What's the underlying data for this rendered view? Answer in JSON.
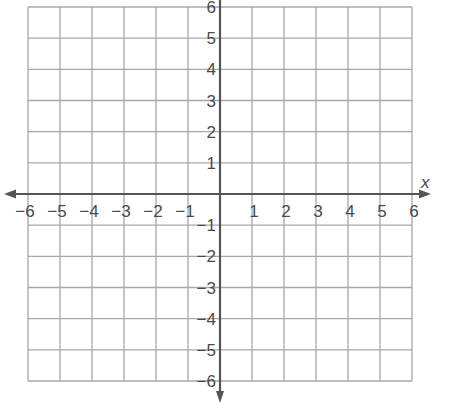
{
  "chart_data": {
    "type": "scatter",
    "title": "",
    "xlabel": "x",
    "ylabel": "",
    "xlim": [
      -6,
      6
    ],
    "ylim": [
      -6,
      6
    ],
    "grid": true,
    "grid_step": 1,
    "x_ticks": [
      -6,
      -5,
      -4,
      -3,
      -2,
      -1,
      1,
      2,
      3,
      4,
      5,
      6
    ],
    "y_ticks": [
      6,
      5,
      4,
      3,
      2,
      1,
      -1,
      -2,
      -3,
      -4,
      -5,
      -6
    ],
    "x_tick_labels": [
      "−6",
      "−5",
      "−4",
      "−3",
      "−2",
      "−1",
      "1",
      "2",
      "3",
      "4",
      "5",
      "6"
    ],
    "y_tick_labels": [
      "6",
      "5",
      "4",
      "3",
      "2",
      "1",
      "−1",
      "−2",
      "−3",
      "−4",
      "−5",
      "−6"
    ],
    "points": [],
    "colors": {
      "grid": "#a8a8a8",
      "axis": "#555555",
      "text": "#4a4a4a"
    }
  }
}
